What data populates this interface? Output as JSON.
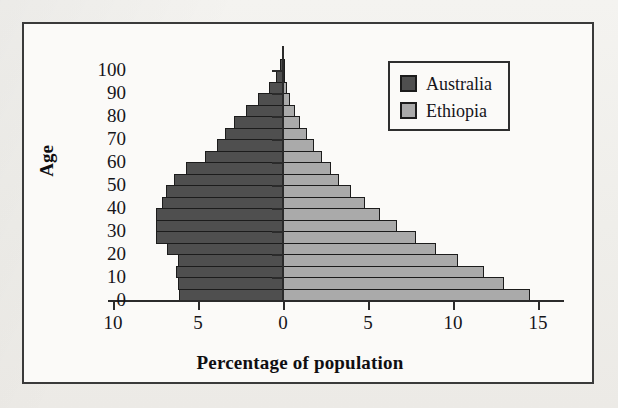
{
  "figure": {
    "frame_color": "#3a3a3a",
    "background": "#fbfaf8"
  },
  "legend": {
    "position": "top-right",
    "entries": [
      {
        "label": "Australia",
        "color": "#4f4f4f",
        "swatch_name": "legend-swatch-australia"
      },
      {
        "label": "Ethiopia",
        "color": "#aaaaaa",
        "swatch_name": "legend-swatch-ethiopia"
      }
    ]
  },
  "axes": {
    "x_title": "Percentage of population",
    "y_title": "Age",
    "x_ticks": [
      "10",
      "5",
      "0",
      "5",
      "10",
      "15"
    ],
    "y_ticks": [
      "0",
      "10",
      "20",
      "30",
      "40",
      "50",
      "60",
      "70",
      "80",
      "90",
      "100"
    ]
  },
  "chart_data": {
    "type": "bar",
    "subtype": "population-pyramid",
    "title": "",
    "xlabel": "Percentage of population",
    "ylabel": "Age",
    "xlim": [
      -10,
      17
    ],
    "ylim": [
      0,
      105
    ],
    "grid": false,
    "legend_position": "top-right",
    "x_tick_values": [
      -10,
      -5,
      0,
      5,
      10,
      15
    ],
    "x_tick_labels": [
      "10",
      "5",
      "0",
      "5",
      "10",
      "15"
    ],
    "y_tick_values": [
      0,
      10,
      20,
      30,
      40,
      50,
      60,
      70,
      80,
      90,
      100
    ],
    "y_tick_labels": [
      "0",
      "10",
      "20",
      "30",
      "40",
      "50",
      "60",
      "70",
      "80",
      "90",
      "100"
    ],
    "categories": [
      "0-4",
      "5-9",
      "10-14",
      "15-19",
      "20-24",
      "25-29",
      "30-34",
      "35-39",
      "40-44",
      "45-49",
      "50-54",
      "55-59",
      "60-64",
      "65-69",
      "70-74",
      "75-79",
      "80-84",
      "85-89",
      "90-94",
      "95-99",
      "100+"
    ],
    "series": [
      {
        "name": "Australia",
        "side": "left",
        "color": "#4f4f4f",
        "values": [
          6.1,
          6.2,
          6.3,
          6.2,
          6.8,
          7.5,
          7.5,
          7.5,
          7.1,
          6.9,
          6.4,
          5.7,
          4.6,
          3.9,
          3.4,
          2.9,
          2.2,
          1.5,
          0.8,
          0.4,
          0.2
        ]
      },
      {
        "name": "Ethiopia",
        "side": "right",
        "color": "#aaaaaa",
        "values": [
          14.5,
          13.0,
          11.8,
          10.3,
          9.0,
          7.8,
          6.7,
          5.7,
          4.8,
          4.0,
          3.3,
          2.8,
          2.3,
          1.8,
          1.4,
          1.0,
          0.7,
          0.4,
          0.25,
          0.12,
          0.05
        ]
      }
    ]
  }
}
